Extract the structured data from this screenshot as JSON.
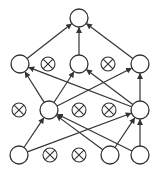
{
  "colors": {
    "stroke": "#333333",
    "background": "#ffffff"
  },
  "node_radius": 9,
  "dropped_radius": 7,
  "layers": [
    {
      "name": "input",
      "nodes": [
        {
          "id": "i1",
          "x": 19,
          "y": 155,
          "dropped": false
        },
        {
          "id": "i2",
          "x": 50,
          "y": 155,
          "dropped": true
        },
        {
          "id": "i3",
          "x": 79,
          "y": 155,
          "dropped": true
        },
        {
          "id": "i4",
          "x": 110,
          "y": 155,
          "dropped": false
        },
        {
          "id": "i5",
          "x": 140,
          "y": 155,
          "dropped": false
        }
      ]
    },
    {
      "name": "hidden1",
      "nodes": [
        {
          "id": "h1",
          "x": 19,
          "y": 110,
          "dropped": true
        },
        {
          "id": "h2",
          "x": 49,
          "y": 110,
          "dropped": false
        },
        {
          "id": "h3",
          "x": 79,
          "y": 110,
          "dropped": true
        },
        {
          "id": "h4",
          "x": 109,
          "y": 110,
          "dropped": true
        },
        {
          "id": "h5",
          "x": 140,
          "y": 110,
          "dropped": false
        }
      ]
    },
    {
      "name": "hidden2",
      "nodes": [
        {
          "id": "g1",
          "x": 20,
          "y": 64,
          "dropped": false
        },
        {
          "id": "g2",
          "x": 48,
          "y": 64,
          "dropped": true
        },
        {
          "id": "g3",
          "x": 79,
          "y": 64,
          "dropped": false
        },
        {
          "id": "g4",
          "x": 108,
          "y": 64,
          "dropped": true
        },
        {
          "id": "g5",
          "x": 140,
          "y": 64,
          "dropped": false
        }
      ]
    },
    {
      "name": "output",
      "nodes": [
        {
          "id": "o1",
          "x": 79,
          "y": 18,
          "dropped": false
        }
      ]
    }
  ],
  "edges": [
    [
      "i1",
      "h2"
    ],
    [
      "i1",
      "h5"
    ],
    [
      "i4",
      "h2"
    ],
    [
      "i4",
      "h5"
    ],
    [
      "i5",
      "h2"
    ],
    [
      "i5",
      "h5"
    ],
    [
      "h2",
      "g1"
    ],
    [
      "h2",
      "g3"
    ],
    [
      "h2",
      "g5"
    ],
    [
      "h5",
      "g1"
    ],
    [
      "h5",
      "g3"
    ],
    [
      "h5",
      "g5"
    ],
    [
      "g1",
      "o1"
    ],
    [
      "g3",
      "o1"
    ],
    [
      "g5",
      "o1"
    ]
  ]
}
